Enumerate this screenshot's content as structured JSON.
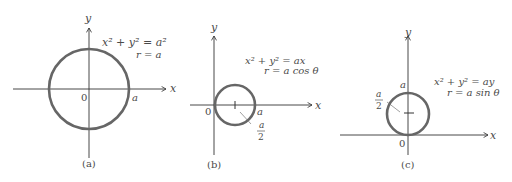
{
  "figure": {
    "panels": [
      {
        "id": "a",
        "caption": "(a)",
        "axis_x_label": "x",
        "axis_y_label": "y",
        "origin_label": "0",
        "equation_cartesian": "x² + y² = a²",
        "equation_polar": "r = a",
        "point_labels": [
          "a"
        ]
      },
      {
        "id": "b",
        "caption": "(b)",
        "axis_x_label": "x",
        "axis_y_label": "y",
        "origin_label": "0",
        "equation_cartesian": "x² + y² = ax",
        "equation_polar": "r = a cos θ",
        "point_labels": [
          "a"
        ],
        "radius_label_num": "a",
        "radius_label_den": "2"
      },
      {
        "id": "c",
        "caption": "(c)",
        "axis_x_label": "x",
        "axis_y_label": "y",
        "origin_label": "0",
        "equation_cartesian": "x² + y² = ay",
        "equation_polar": "r = a sin θ",
        "point_labels": [
          "a"
        ],
        "radius_label_num": "a",
        "radius_label_den": "2"
      }
    ],
    "colors": {
      "axis": "#333333",
      "circle": "#666666",
      "text": "#4a4a4a"
    }
  }
}
